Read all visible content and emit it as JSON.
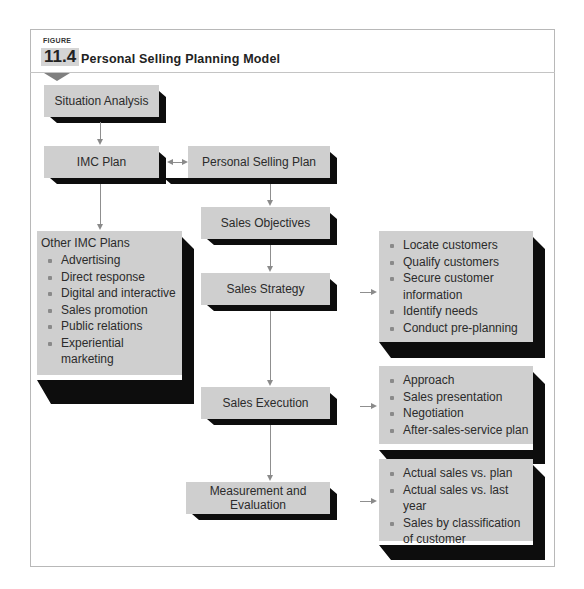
{
  "figure": {
    "label": "FIGURE",
    "number": "11.4",
    "title": "Personal Selling Planning Model"
  },
  "nodes": {
    "situation_analysis": "Situation Analysis",
    "imc_plan": "IMC Plan",
    "personal_selling_plan": "Personal Selling Plan",
    "sales_objectives": "Sales Objectives",
    "sales_strategy": "Sales Strategy",
    "sales_execution": "Sales Execution",
    "measurement_evaluation": "Measurement and Evaluation"
  },
  "other_imc_plans": {
    "title": "Other IMC Plans",
    "items": [
      "Advertising",
      "Direct response",
      "Digital and interactive",
      "Sales promotion",
      "Public relations",
      "Experiential marketing"
    ]
  },
  "strategy_list": {
    "items": [
      "Locate customers",
      "Qualify customers",
      "Secure customer information",
      "Identify needs",
      "Conduct pre-planning"
    ]
  },
  "execution_list": {
    "items": [
      "Approach",
      "Sales presentation",
      "Negotiation",
      "After-sales-service plan"
    ]
  },
  "evaluation_list": {
    "items": [
      "Actual sales vs. plan",
      "Actual sales vs. last year",
      "Sales by classification of customer"
    ]
  },
  "colors": {
    "box_fill": "#cfcfcf",
    "box_shadow": "#0d0d0d",
    "connector": "#8f8f8f",
    "frame": "#b8b8b8"
  }
}
